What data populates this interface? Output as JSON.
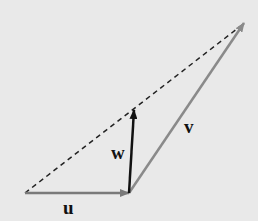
{
  "figure": {
    "background": "#e9e9e9",
    "colors": {
      "u": "#7a7a7a",
      "v": "#8a8a8a",
      "w": "#111111",
      "dashed": "#222222"
    },
    "vectors": [
      {
        "name": "u",
        "label": "u",
        "from": [
          25,
          193
        ],
        "to": [
          129,
          193
        ]
      },
      {
        "name": "v",
        "label": "v",
        "from": [
          129,
          193
        ],
        "to": [
          244,
          23
        ]
      },
      {
        "name": "w",
        "label": "w",
        "from": [
          129,
          193
        ],
        "to": [
          134,
          110
        ]
      }
    ],
    "dashed_line": {
      "from": [
        25,
        193
      ],
      "to": [
        244,
        23
      ]
    },
    "labels": {
      "u": "u",
      "v": "v",
      "w": "w"
    }
  }
}
